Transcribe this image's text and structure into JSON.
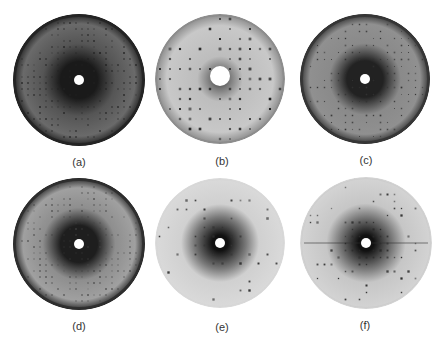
{
  "figure": {
    "panels": [
      {
        "id": "a",
        "label": "(a)",
        "cx": 79,
        "cy": 80,
        "r": 66,
        "style": "dark-dense",
        "bg_center": "#1a1a1a",
        "bg_mid": "#555555",
        "bg_edge": "#6a6a6a",
        "rim": "#222222",
        "beamstop_r": 5,
        "spot_color": "#222222",
        "spot_spacing": 6,
        "spot_size": 1.4
      },
      {
        "id": "b",
        "label": "(b)",
        "cx": 220,
        "cy": 79,
        "r": 65,
        "style": "light-lattice",
        "bg_center": "#333333",
        "bg_mid": "#bdbdbd",
        "bg_edge": "#9a9a9a",
        "rim": "#8a8a8a",
        "beamstop_r": 10,
        "spot_color": "#1e1e1e",
        "spot_spacing": 10,
        "spot_size": 2.2
      },
      {
        "id": "c",
        "label": "(c)",
        "cx": 365,
        "cy": 79,
        "r": 65,
        "style": "gray-ring",
        "bg_center": "#222222",
        "bg_mid": "#8a8a8a",
        "bg_edge": "#909090",
        "rim": "#333333",
        "beamstop_r": 5,
        "spot_color": "#333333",
        "spot_spacing": 7,
        "spot_size": 1.3
      },
      {
        "id": "d",
        "label": "(d)",
        "cx": 79,
        "cy": 244,
        "r": 66,
        "style": "gray-ring",
        "bg_center": "#1e1e1e",
        "bg_mid": "#8e8e8e",
        "bg_edge": "#a0a0a0",
        "rim": "#2a2a2a",
        "beamstop_r": 5,
        "spot_color": "#444444",
        "spot_spacing": 6,
        "spot_size": 1.3
      },
      {
        "id": "e",
        "label": "(e)",
        "cx": 220,
        "cy": 243,
        "r": 65,
        "style": "light-sparse",
        "bg_center": "#111111",
        "bg_mid": "#d0d0d0",
        "bg_edge": "#dadada",
        "rim": "#d6d6d6",
        "beamstop_r": 5,
        "spot_color": "#333333",
        "spot_spacing": 9,
        "spot_size": 2.0
      },
      {
        "id": "f",
        "label": "(f)",
        "cx": 366,
        "cy": 243,
        "r": 66,
        "style": "light-sparse",
        "bg_center": "#111111",
        "bg_mid": "#c6c6c6",
        "bg_edge": "#d4d4d4",
        "rim": "#cccccc",
        "beamstop_r": 5,
        "spot_color": "#2a2a2a",
        "spot_spacing": 7,
        "spot_size": 1.8
      }
    ],
    "label_positions": [
      {
        "x": 79,
        "y": 162
      },
      {
        "x": 222,
        "y": 161
      },
      {
        "x": 366,
        "y": 160
      },
      {
        "x": 79,
        "y": 326
      },
      {
        "x": 222,
        "y": 327
      },
      {
        "x": 365,
        "y": 325
      }
    ]
  }
}
